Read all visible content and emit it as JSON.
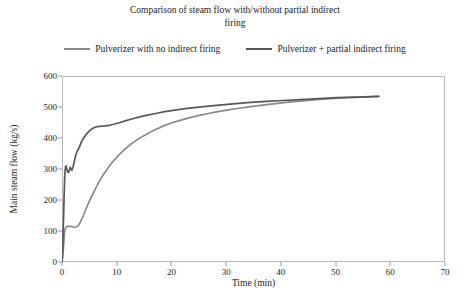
{
  "chart_data": {
    "type": "line",
    "title": "Comparison of steam flow with/without partial indirect\nfiring",
    "xlabel": "Time (min)",
    "ylabel": "Main steam flow (kg/s)",
    "xlim": [
      0,
      70
    ],
    "ylim": [
      0,
      600
    ],
    "xticks": [
      0,
      10,
      20,
      30,
      40,
      50,
      60,
      70
    ],
    "yticks": [
      0,
      100,
      200,
      300,
      400,
      500,
      600
    ],
    "grid": false,
    "legend_position": "top",
    "series": [
      {
        "name": "Pulverizer with no indirect firing",
        "color": "#8a8a8a",
        "points": [
          [
            0.0,
            0
          ],
          [
            0.15,
            18
          ],
          [
            0.3,
            55
          ],
          [
            0.45,
            92
          ],
          [
            0.6,
            108
          ],
          [
            0.9,
            114
          ],
          [
            1.3,
            116
          ],
          [
            1.8,
            114
          ],
          [
            2.2,
            112
          ],
          [
            2.6,
            113
          ],
          [
            3.0,
            118
          ],
          [
            3.4,
            130
          ],
          [
            3.9,
            150
          ],
          [
            4.4,
            172
          ],
          [
            5.0,
            196
          ],
          [
            5.6,
            218
          ],
          [
            6.3,
            243
          ],
          [
            7.0,
            266
          ],
          [
            7.8,
            288
          ],
          [
            8.6,
            308
          ],
          [
            9.5,
            328
          ],
          [
            10.5,
            347
          ],
          [
            11.5,
            364
          ],
          [
            12.5,
            379
          ],
          [
            13.6,
            393
          ],
          [
            14.8,
            406
          ],
          [
            16.0,
            418
          ],
          [
            17.3,
            429
          ],
          [
            18.7,
            440
          ],
          [
            20.1,
            449
          ],
          [
            21.6,
            457
          ],
          [
            23.2,
            465
          ],
          [
            24.9,
            472
          ],
          [
            26.7,
            479
          ],
          [
            28.5,
            485
          ],
          [
            30.4,
            491
          ],
          [
            32.4,
            496
          ],
          [
            34.5,
            501
          ],
          [
            36.7,
            506
          ],
          [
            39.0,
            511
          ],
          [
            41.4,
            516
          ],
          [
            43.9,
            520
          ],
          [
            46.5,
            524
          ],
          [
            49.2,
            527
          ],
          [
            52.0,
            530
          ],
          [
            54.9,
            532
          ],
          [
            57.9,
            534
          ]
        ]
      },
      {
        "name": "Pulverizer + partial indirect firing",
        "color": "#585858",
        "points": [
          [
            0.0,
            0
          ],
          [
            0.12,
            40
          ],
          [
            0.25,
            120
          ],
          [
            0.38,
            210
          ],
          [
            0.5,
            278
          ],
          [
            0.62,
            305
          ],
          [
            0.75,
            310
          ],
          [
            0.9,
            300
          ],
          [
            1.05,
            290
          ],
          [
            1.2,
            289
          ],
          [
            1.35,
            296
          ],
          [
            1.5,
            306
          ],
          [
            1.65,
            300
          ],
          [
            1.8,
            296
          ],
          [
            2.0,
            305
          ],
          [
            2.2,
            320
          ],
          [
            2.45,
            340
          ],
          [
            2.7,
            355
          ],
          [
            2.95,
            362
          ],
          [
            3.2,
            372
          ],
          [
            3.5,
            385
          ],
          [
            3.8,
            396
          ],
          [
            4.1,
            404
          ],
          [
            4.45,
            412
          ],
          [
            4.8,
            419
          ],
          [
            5.2,
            426
          ],
          [
            5.6,
            431
          ],
          [
            6.1,
            435
          ],
          [
            6.6,
            437
          ],
          [
            7.2,
            438
          ],
          [
            7.9,
            439
          ],
          [
            8.7,
            441
          ],
          [
            9.6,
            445
          ],
          [
            10.6,
            450
          ],
          [
            11.7,
            456
          ],
          [
            12.9,
            462
          ],
          [
            14.2,
            468
          ],
          [
            15.6,
            474
          ],
          [
            17.1,
            479
          ],
          [
            18.8,
            485
          ],
          [
            20.6,
            490
          ],
          [
            22.5,
            495
          ],
          [
            24.6,
            499
          ],
          [
            26.8,
            503
          ],
          [
            29.2,
            507
          ],
          [
            31.8,
            511
          ],
          [
            34.5,
            515
          ],
          [
            37.4,
            518
          ],
          [
            40.4,
            521
          ],
          [
            43.6,
            524
          ],
          [
            46.9,
            527
          ],
          [
            50.3,
            530
          ],
          [
            53.9,
            532
          ],
          [
            57.9,
            534
          ]
        ]
      }
    ]
  }
}
